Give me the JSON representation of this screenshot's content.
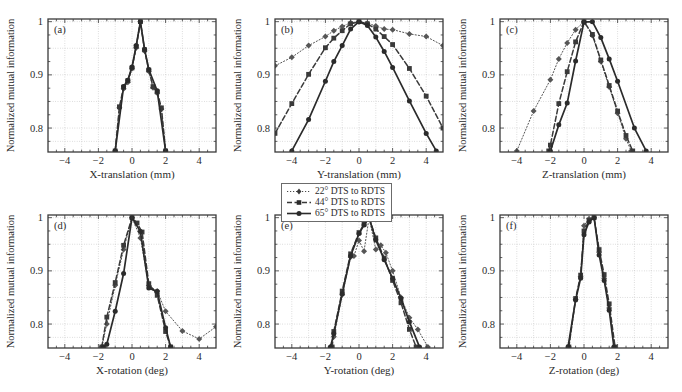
{
  "figure": {
    "ylabel": "Normalized mutual information",
    "ytick_labels": [
      "1",
      "0.9",
      "0.8"
    ],
    "xtick_labels": [
      "−4",
      "−2",
      "0",
      "2",
      "4"
    ]
  },
  "legend": {
    "position": "below-panel-b",
    "entries": [
      {
        "label": "22° DTS to RDTS",
        "style": "dotted",
        "marker": "diamond",
        "color": "#4a4a4a"
      },
      {
        "label": "44° DTS to RDTS",
        "style": "dashed",
        "marker": "square",
        "color": "#3a3a3a"
      },
      {
        "label": "65° DTS to RDTS",
        "style": "solid",
        "marker": "circle",
        "color": "#2b2b2b"
      }
    ]
  },
  "chart_data": [
    {
      "type": "line",
      "panel": "(a)",
      "title": "",
      "xlabel": "X-translation (mm)",
      "ylabel": "Normalized mutual information",
      "xlim": [
        -5,
        5
      ],
      "ylim": [
        0.755,
        1.005
      ],
      "xticks": [
        -4,
        -2,
        0,
        2,
        4
      ],
      "yticks": [
        1,
        0.9,
        0.8
      ],
      "grid": true,
      "series": [
        {
          "name": "22° DTS to RDTS",
          "style": "dotted",
          "x": [
            -1.0,
            -0.75,
            -0.5,
            -0.25,
            0.0,
            0.25,
            0.5,
            0.75,
            1.0,
            1.25,
            1.5,
            1.75,
            2.0
          ],
          "y": [
            0.757,
            0.838,
            0.874,
            0.886,
            0.912,
            0.951,
            1.0,
            0.945,
            0.907,
            0.876,
            0.866,
            0.836,
            0.757
          ]
        },
        {
          "name": "44° DTS to RDTS",
          "style": "dashed",
          "x": [
            -1.0,
            -0.75,
            -0.5,
            -0.25,
            0.0,
            0.25,
            0.5,
            0.75,
            1.0,
            1.25,
            1.5,
            1.75,
            2.0
          ],
          "y": [
            0.757,
            0.84,
            0.877,
            0.889,
            0.913,
            0.953,
            1.0,
            0.947,
            0.909,
            0.878,
            0.868,
            0.838,
            0.757
          ]
        },
        {
          "name": "65° DTS to RDTS",
          "style": "solid",
          "x": [
            -1.0,
            -0.5,
            -0.25,
            0.0,
            0.25,
            0.5,
            0.75,
            1.0,
            1.5,
            2.0
          ],
          "y": [
            0.757,
            0.878,
            0.89,
            0.915,
            0.955,
            1.0,
            0.948,
            0.91,
            0.87,
            0.757
          ]
        }
      ]
    },
    {
      "type": "line",
      "panel": "(b)",
      "title": "",
      "xlabel": "Y-translation (mm)",
      "ylabel": "Normalized mutual information",
      "xlim": [
        -5,
        5
      ],
      "ylim": [
        0.755,
        1.005
      ],
      "xticks": [
        -4,
        -2,
        0,
        2,
        4
      ],
      "yticks": [
        1,
        0.9,
        0.8
      ],
      "grid": true,
      "series": [
        {
          "name": "22° DTS to RDTS",
          "style": "dotted",
          "x": [
            -5.0,
            -4.0,
            -3.0,
            -2.0,
            -1.5,
            -1.0,
            -0.5,
            0.0,
            0.5,
            1.0,
            1.5,
            2.0,
            3.0,
            4.0,
            5.0
          ],
          "y": [
            0.917,
            0.933,
            0.955,
            0.972,
            0.983,
            0.991,
            0.998,
            1.0,
            0.997,
            0.992,
            0.986,
            0.985,
            0.977,
            0.972,
            0.955
          ]
        },
        {
          "name": "44° DTS to RDTS",
          "style": "dashed",
          "x": [
            -5.0,
            -4.0,
            -3.0,
            -2.0,
            -1.5,
            -1.0,
            -0.5,
            0.0,
            0.5,
            1.0,
            1.5,
            2.0,
            3.0,
            4.0,
            5.0
          ],
          "y": [
            0.79,
            0.846,
            0.901,
            0.951,
            0.969,
            0.983,
            0.996,
            1.0,
            0.996,
            0.986,
            0.972,
            0.957,
            0.912,
            0.86,
            0.8
          ]
        },
        {
          "name": "65° DTS to RDTS",
          "style": "solid",
          "x": [
            -4.0,
            -3.0,
            -2.0,
            -1.5,
            -1.0,
            -0.5,
            0.0,
            0.5,
            1.0,
            1.5,
            2.0,
            3.0,
            4.0,
            4.6
          ],
          "y": [
            0.757,
            0.816,
            0.888,
            0.925,
            0.955,
            0.986,
            1.0,
            0.993,
            0.971,
            0.944,
            0.914,
            0.851,
            0.79,
            0.757
          ]
        }
      ]
    },
    {
      "type": "line",
      "panel": "(c)",
      "title": "",
      "xlabel": "Z-translation (mm)",
      "ylabel": "Normalized mutual information",
      "xlim": [
        -5,
        5
      ],
      "ylim": [
        0.755,
        1.005
      ],
      "xticks": [
        -4,
        -2,
        0,
        2,
        4
      ],
      "yticks": [
        1,
        0.9,
        0.8
      ],
      "grid": true,
      "series": [
        {
          "name": "22° DTS to RDTS",
          "style": "dotted",
          "x": [
            -4.0,
            -3.0,
            -2.0,
            -1.5,
            -1.0,
            -0.5,
            0.0,
            0.5,
            1.0,
            1.5,
            2.0,
            2.5,
            2.8
          ],
          "y": [
            0.757,
            0.832,
            0.891,
            0.93,
            0.96,
            0.985,
            1.0,
            0.974,
            0.925,
            0.877,
            0.828,
            0.78,
            0.757
          ]
        },
        {
          "name": "44° DTS to RDTS",
          "style": "dashed",
          "x": [
            -2.1,
            -2.0,
            -1.5,
            -1.0,
            -0.5,
            0.0,
            0.5,
            1.0,
            1.5,
            2.0,
            2.5,
            2.9
          ],
          "y": [
            0.757,
            0.768,
            0.846,
            0.906,
            0.962,
            1.0,
            0.976,
            0.928,
            0.88,
            0.832,
            0.786,
            0.757
          ]
        },
        {
          "name": "65° DTS to RDTS",
          "style": "solid",
          "x": [
            -2.0,
            -1.5,
            -1.0,
            -0.5,
            0.0,
            0.5,
            1.0,
            1.5,
            2.0,
            3.0,
            3.7
          ],
          "y": [
            0.757,
            0.806,
            0.847,
            0.926,
            0.999,
            1.0,
            0.97,
            0.93,
            0.888,
            0.8,
            0.757
          ]
        }
      ]
    },
    {
      "type": "line",
      "panel": "(d)",
      "title": "",
      "xlabel": "X-rotation (deg)",
      "ylabel": "Normalized mutual information",
      "xlim": [
        -5,
        5
      ],
      "ylim": [
        0.755,
        1.005
      ],
      "xticks": [
        -4,
        -2,
        0,
        2,
        4
      ],
      "yticks": [
        1,
        0.9,
        0.8
      ],
      "grid": true,
      "series": [
        {
          "name": "22° DTS to RDTS",
          "style": "dotted",
          "x": [
            -1.8,
            -1.5,
            -1.0,
            -0.5,
            0.0,
            0.5,
            1.0,
            1.5,
            2.0,
            3.0,
            4.0,
            5.0
          ],
          "y": [
            0.757,
            0.8,
            0.873,
            0.94,
            1.0,
            0.962,
            0.872,
            0.862,
            0.824,
            0.787,
            0.772,
            0.795
          ]
        },
        {
          "name": "44° DTS to RDTS",
          "style": "dashed",
          "x": [
            -1.8,
            -1.5,
            -1.0,
            -0.5,
            0.0,
            0.3,
            0.6,
            1.0,
            1.5,
            2.0,
            2.3
          ],
          "y": [
            0.757,
            0.813,
            0.878,
            0.948,
            1.0,
            0.99,
            0.973,
            0.876,
            0.854,
            0.786,
            0.757
          ]
        },
        {
          "name": "65° DTS to RDTS",
          "style": "solid",
          "x": [
            -1.7,
            -1.5,
            -1.0,
            -0.5,
            0.0,
            0.5,
            1.0,
            1.5,
            2.0,
            2.3
          ],
          "y": [
            0.757,
            0.762,
            0.824,
            0.895,
            1.0,
            0.974,
            0.868,
            0.861,
            0.793,
            0.757
          ]
        }
      ]
    },
    {
      "type": "line",
      "panel": "(e)",
      "title": "",
      "xlabel": "Y-rotation (deg)",
      "ylabel": "Normalized mutual information",
      "xlim": [
        -5,
        5
      ],
      "ylim": [
        0.755,
        1.005
      ],
      "xticks": [
        -4,
        -2,
        0,
        2,
        4
      ],
      "yticks": [
        1,
        0.9,
        0.8
      ],
      "grid": true,
      "series": [
        {
          "name": "22° DTS to RDTS",
          "style": "dotted",
          "x": [
            -1.7,
            -1.5,
            -1.0,
            -0.5,
            -0.3,
            0.0,
            0.3,
            0.6,
            1.0,
            1.3,
            1.6,
            2.0,
            2.5,
            3.0,
            3.5,
            4.1
          ],
          "y": [
            0.757,
            0.776,
            0.855,
            0.926,
            0.928,
            0.957,
            0.937,
            1.0,
            0.94,
            0.948,
            0.934,
            0.9,
            0.85,
            0.812,
            0.79,
            0.757
          ]
        },
        {
          "name": "44° DTS to RDTS",
          "style": "dashed",
          "x": [
            -1.6,
            -1.5,
            -1.0,
            -0.5,
            0.0,
            0.3,
            0.6,
            1.0,
            1.5,
            2.0,
            2.5,
            3.0,
            3.4
          ],
          "y": [
            0.757,
            0.786,
            0.862,
            0.932,
            0.972,
            0.988,
            1.0,
            0.962,
            0.924,
            0.882,
            0.84,
            0.79,
            0.757
          ]
        },
        {
          "name": "65° DTS to RDTS",
          "style": "solid",
          "x": [
            -1.7,
            -1.5,
            -1.0,
            -0.5,
            0.0,
            0.3,
            0.6,
            1.0,
            1.5,
            2.0,
            2.5,
            3.0,
            3.6
          ],
          "y": [
            0.757,
            0.782,
            0.857,
            0.928,
            0.97,
            0.986,
            1.0,
            0.958,
            0.921,
            0.886,
            0.848,
            0.804,
            0.757
          ]
        }
      ]
    },
    {
      "type": "line",
      "panel": "(f)",
      "title": "",
      "xlabel": "Z-rotation (deg)",
      "ylabel": "Normalized mutual information",
      "xlim": [
        -5,
        5
      ],
      "ylim": [
        0.755,
        1.005
      ],
      "xticks": [
        -4,
        -2,
        0,
        2,
        4
      ],
      "yticks": [
        1,
        0.9,
        0.8
      ],
      "grid": true,
      "series": [
        {
          "name": "22° DTS to RDTS",
          "style": "dotted",
          "x": [
            -0.9,
            -0.5,
            -0.2,
            0.0,
            0.3,
            0.6,
            0.9,
            1.2,
            1.5,
            1.8
          ],
          "y": [
            0.757,
            0.846,
            0.889,
            0.985,
            0.998,
            1.0,
            0.935,
            0.886,
            0.83,
            0.757
          ]
        },
        {
          "name": "44° DTS to RDTS",
          "style": "dashed",
          "x": [
            -0.9,
            -0.5,
            -0.2,
            0.0,
            0.3,
            0.6,
            0.9,
            1.2,
            1.5,
            1.85
          ],
          "y": [
            0.757,
            0.848,
            0.892,
            0.975,
            0.995,
            1.0,
            0.94,
            0.893,
            0.838,
            0.757
          ]
        },
        {
          "name": "65° DTS to RDTS",
          "style": "solid",
          "x": [
            -0.95,
            -0.5,
            -0.2,
            0.0,
            0.3,
            0.6,
            0.9,
            1.2,
            1.5,
            1.78
          ],
          "y": [
            0.757,
            0.845,
            0.886,
            0.968,
            0.992,
            1.0,
            0.93,
            0.882,
            0.826,
            0.757
          ]
        }
      ]
    }
  ]
}
